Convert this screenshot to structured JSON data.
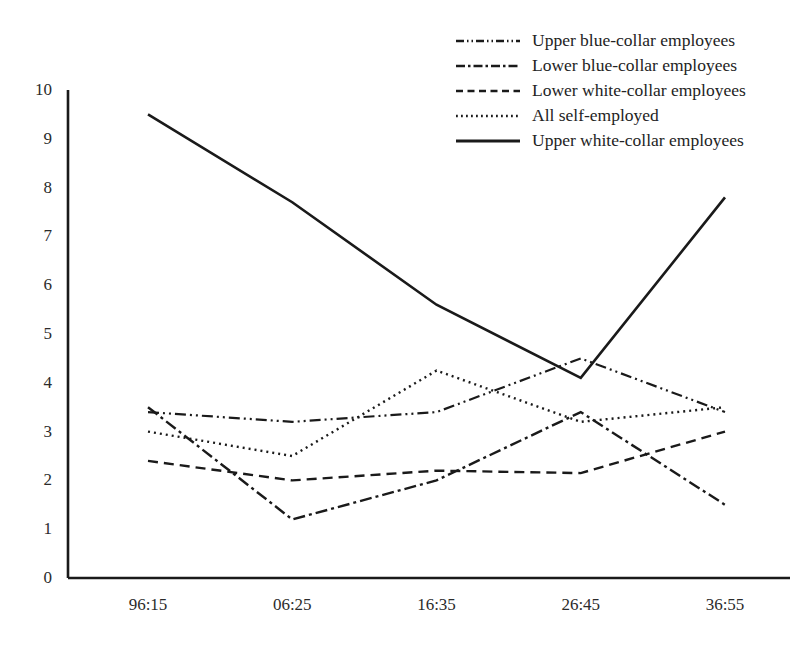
{
  "chart_data": {
    "type": "line",
    "title": "",
    "xlabel": "",
    "ylabel": "",
    "categories": [
      "96:15",
      "06:25",
      "16:35",
      "26:45",
      "36:55"
    ],
    "ylim": [
      0,
      10
    ],
    "yticks": [
      0,
      1,
      2,
      3,
      4,
      5,
      6,
      7,
      8,
      9,
      10
    ],
    "grid": false,
    "legend_position": "top-right",
    "series": [
      {
        "name": "Upper blue-collar employees",
        "style": "dash-dot-dot",
        "dasharray": "11,4,2,4,2,4",
        "color": "#1a1a1a",
        "width": 2.2,
        "values": [
          3.4,
          3.2,
          3.4,
          4.5,
          3.4
        ]
      },
      {
        "name": "Lower blue-collar employees",
        "style": "dash-dot",
        "dasharray": "12,4,3,4",
        "color": "#1a1a1a",
        "width": 2.4,
        "values": [
          3.5,
          1.2,
          2.0,
          3.4,
          1.5
        ]
      },
      {
        "name": "Lower white-collar employees",
        "style": "dashed",
        "dasharray": "10,6",
        "color": "#1a1a1a",
        "width": 2.4,
        "values": [
          2.4,
          2.0,
          2.2,
          2.15,
          3.0
        ]
      },
      {
        "name": "All self-employed",
        "style": "dotted",
        "dasharray": "2,4",
        "color": "#1a1a1a",
        "width": 2.4,
        "values": [
          3.0,
          2.5,
          4.25,
          3.2,
          3.5
        ]
      },
      {
        "name": "Upper white-collar employees",
        "style": "solid",
        "dasharray": "none",
        "color": "#1a1a1a",
        "width": 2.6,
        "values": [
          9.5,
          7.7,
          5.6,
          4.1,
          7.8
        ]
      }
    ]
  },
  "axes": {
    "y_tick_labels": [
      "10",
      "9",
      "8",
      "7",
      "6",
      "5",
      "4",
      "3",
      "2",
      "1",
      "0"
    ],
    "x_tick_labels": [
      "96:15",
      "06:25",
      "16:35",
      "26:45",
      "36:55"
    ],
    "axis_color": "#1a1a1a"
  },
  "legend": {
    "entries": [
      {
        "label": "Upper blue-collar employees",
        "dasharray": "8,3,1.5,3,1.5,3"
      },
      {
        "label": "Lower blue-collar employees",
        "dasharray": "9,3,2.5,3"
      },
      {
        "label": "Lower white-collar employees",
        "dasharray": "7,4.5"
      },
      {
        "label": "All self-employed",
        "dasharray": "1.8,3.2"
      },
      {
        "label": "Upper white-collar employees",
        "dasharray": "none"
      }
    ]
  }
}
